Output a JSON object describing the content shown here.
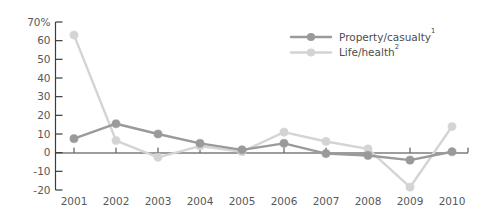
{
  "chart_data": {
    "type": "line",
    "title": "",
    "subtitle": "",
    "xlabel": "",
    "ylabel": "",
    "categories": [
      "2001",
      "2002",
      "2003",
      "2004",
      "2005",
      "2006",
      "2007",
      "2008",
      "2009",
      "2010"
    ],
    "x": [
      2001,
      2002,
      2003,
      2004,
      2005,
      2006,
      2007,
      2008,
      2009,
      2010
    ],
    "series": [
      {
        "name": "Property/casualty",
        "footnote_marker": "1",
        "color": "#9a9a9a",
        "marker": "circle",
        "values": [
          7.5,
          15.5,
          10.0,
          5.0,
          1.5,
          5.0,
          -0.5,
          -1.5,
          -4.0,
          0.5
        ]
      },
      {
        "name": "Life/health",
        "footnote_marker": "2",
        "color": "#d4d4d4",
        "marker": "circle",
        "values": [
          63.0,
          6.5,
          -2.5,
          3.5,
          0.5,
          11.0,
          6.0,
          2.0,
          -18.5,
          14.0
        ]
      }
    ],
    "ylim": [
      -20,
      70
    ],
    "ytick_values": [
      70,
      60,
      50,
      40,
      30,
      20,
      10,
      0,
      -10,
      -20
    ],
    "ytick_labels": [
      "70%",
      "60",
      "50",
      "40",
      "30",
      "20",
      "10",
      "0",
      "-10",
      "-20"
    ],
    "xlim": [
      2000.6,
      2010.7
    ],
    "grid": false,
    "zero_line": true,
    "legend_position": "top-right",
    "legend": [
      {
        "label": "Property/casualty",
        "sup": "1"
      },
      {
        "label": "Life/health",
        "sup": "2"
      }
    ]
  },
  "colors": {
    "property_casualty": "#9a9a9a",
    "life_health": "#d4d4d4",
    "axis": "#3c3c3c",
    "text": "#58595b"
  }
}
